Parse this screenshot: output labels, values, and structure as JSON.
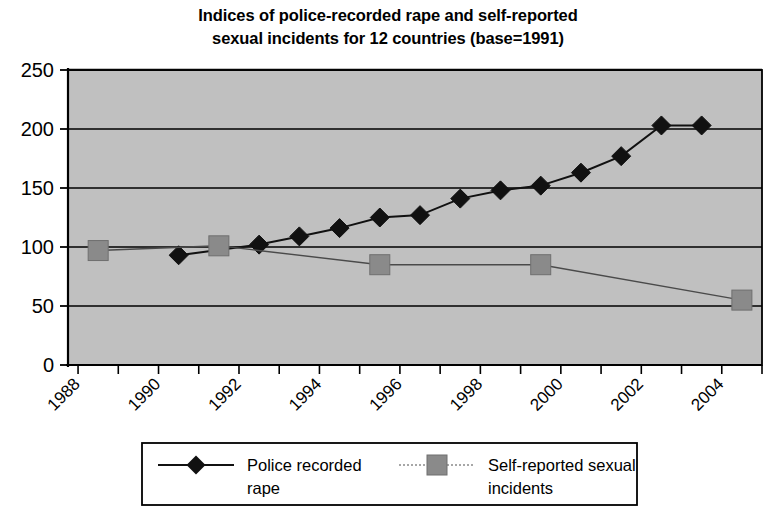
{
  "chart_data": {
    "type": "line",
    "title": "Indices of police-recorded rape and self-reported sexual incidents for 12 countries (base=1991)",
    "title_line1": "Indices of police-recorded rape and self-reported",
    "title_line2": "sexual incidents for 12 countries (base=1991)",
    "xlabel": "",
    "ylabel": "",
    "xlim": [
      1987.75,
      2005.0
    ],
    "ylim": [
      0,
      250
    ],
    "yticks": [
      0,
      50,
      100,
      150,
      200,
      250
    ],
    "ytick_labels": [
      "0",
      "50",
      "100",
      "150",
      "200",
      "250"
    ],
    "xticks": [
      1988,
      1989,
      1990,
      1991,
      1992,
      1993,
      1994,
      1995,
      1996,
      1997,
      1998,
      1999,
      2000,
      2001,
      2002,
      2003,
      2004,
      2005
    ],
    "xtick_labels": [
      "1988",
      "1990",
      "1992",
      "1994",
      "1996",
      "1998",
      "2000",
      "2002",
      "2004"
    ],
    "xtick_label_values": [
      1988,
      1990,
      1992,
      1994,
      1996,
      1998,
      2000,
      2002,
      2004
    ],
    "grid": "horizontal",
    "plot_background": "#c0c0c0",
    "legend_position": "bottom",
    "series": [
      {
        "name": "Police recorded rape",
        "marker": "diamond",
        "color": "#000000",
        "line_style": "solid",
        "x": [
          1990.5,
          1992.5,
          1993.5,
          1994.5,
          1995.5,
          1996.5,
          1997.5,
          1998.5,
          1999.5,
          2000.5,
          2001.5,
          2002.5,
          2003.5
        ],
        "y": [
          93,
          102,
          109,
          116,
          125,
          127,
          141,
          148,
          152,
          163,
          177,
          203,
          203
        ]
      },
      {
        "name": "Self-reported sexual incidents",
        "marker": "square",
        "color": "#808080",
        "line_style": "dotted",
        "x": [
          1988.5,
          1991.5,
          1995.5,
          1999.5,
          2004.5
        ],
        "y": [
          97,
          101,
          85,
          85,
          55
        ]
      }
    ],
    "legend_entries": [
      {
        "label_line1": "Police recorded",
        "label_line2": "rape",
        "marker": "diamond",
        "color": "#000000"
      },
      {
        "label_line1": "Self-reported sexual",
        "label_line2": "incidents",
        "marker": "square",
        "color": "#808080"
      }
    ]
  }
}
